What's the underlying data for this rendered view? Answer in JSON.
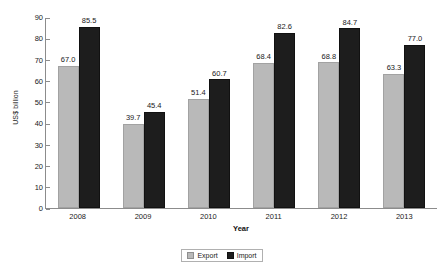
{
  "chart_data": {
    "type": "bar",
    "title": "",
    "xlabel": "Year",
    "ylabel": "US$ billion",
    "categories": [
      "2008",
      "2009",
      "2010",
      "2011",
      "2012",
      "2013"
    ],
    "series": [
      {
        "name": "Export",
        "color": "#b9b9b9",
        "values": [
          67.0,
          39.7,
          51.4,
          68.4,
          68.8,
          63.3
        ],
        "labels": [
          "67.0",
          "39.7",
          "51.4",
          "68.4",
          "68.8",
          "63.3"
        ]
      },
      {
        "name": "Import",
        "color": "#1d1d1d",
        "values": [
          85.5,
          45.4,
          60.7,
          82.6,
          84.7,
          77.0
        ],
        "labels": [
          "85.5",
          "45.4",
          "60.7",
          "82.6",
          "84.7",
          "77.0"
        ]
      }
    ],
    "ylim": [
      0,
      90
    ],
    "yticks": [
      0,
      10,
      20,
      30,
      40,
      50,
      60,
      70,
      80,
      90
    ],
    "ytick_labels": [
      "0",
      "10",
      "20",
      "30",
      "40",
      "50",
      "60",
      "70",
      "80",
      "90"
    ],
    "grid": false,
    "legend_position": "bottom",
    "legend": [
      "Export",
      "Import"
    ]
  }
}
